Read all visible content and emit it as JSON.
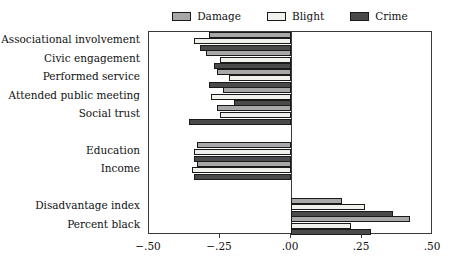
{
  "chart_data": {
    "type": "bar",
    "orientation": "horizontal",
    "title": "",
    "subtitle": "",
    "xlabel": "",
    "ylabel": "",
    "xlim": [
      -0.5,
      0.5
    ],
    "grid": false,
    "legend_position": "top-center",
    "xticks": [
      -0.5,
      -0.25,
      0.0,
      0.25,
      0.5
    ],
    "xtick_labels": [
      "−.50",
      "−.25",
      ".00",
      ".25",
      ".50"
    ],
    "zero_reference": 0.0,
    "categories": [
      "Associational involvement",
      "Civic engagement",
      "Performed service",
      "Attended public meeting",
      "Social trust",
      "Education",
      "Income",
      "Disadvantage index",
      "Percent black"
    ],
    "series": [
      {
        "name": "Damage",
        "color": "#a8a8a8",
        "values": [
          -0.29,
          -0.3,
          -0.26,
          -0.24,
          -0.26,
          -0.33,
          -0.33,
          0.18,
          0.42
        ]
      },
      {
        "name": "Blight",
        "color": "#f2f0ec",
        "values": [
          -0.34,
          -0.25,
          -0.22,
          -0.28,
          -0.25,
          -0.34,
          -0.35,
          0.26,
          0.21
        ]
      },
      {
        "name": "Crime",
        "color": "#4a4a4a",
        "values": [
          -0.32,
          -0.27,
          -0.29,
          -0.2,
          -0.36,
          -0.34,
          -0.34,
          0.36,
          0.28
        ]
      }
    ],
    "group_gaps_after": [
      4,
      6
    ]
  },
  "legend": {
    "entries": [
      {
        "label": "Damage",
        "swatch": "legend-swatch-damage"
      },
      {
        "label": "Blight",
        "swatch": "legend-swatch-blight"
      },
      {
        "label": "Crime",
        "swatch": "legend-swatch-crime"
      }
    ]
  },
  "colors": {
    "damage": "#a8a8a8",
    "blight": "#f2f0ec",
    "crime": "#4a4a4a",
    "outline": "#1a1a1a",
    "frame": "#3a3a3a",
    "background": "#ffffff"
  }
}
